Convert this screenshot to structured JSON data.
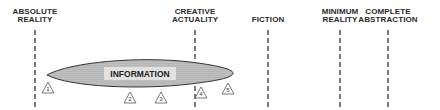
{
  "axis_labels": [
    {
      "id": "absolute-reality",
      "line1": "ABSOLUTE",
      "line2": "REALITY",
      "x": 35
    },
    {
      "id": "creative-actuality",
      "line1": "CREATIVE",
      "line2": "ACTUALITY",
      "x": 195
    },
    {
      "id": "fiction",
      "line1": "",
      "line2": "FICTION",
      "x": 268
    },
    {
      "id": "minimum-reality",
      "line1": "MINIMUM",
      "line2": "REALITY",
      "x": 340
    },
    {
      "id": "complete-abstraction",
      "line1": "COMPLETE",
      "line2": "ABSTRACTION",
      "x": 388
    }
  ],
  "region": {
    "label": "INFORMATION"
  },
  "markers": [
    {
      "num": "1",
      "x": 48,
      "y": 88
    },
    {
      "num": "2",
      "x": 130,
      "y": 98
    },
    {
      "num": "3",
      "x": 161,
      "y": 98
    },
    {
      "num": "4",
      "x": 201,
      "y": 93
    },
    {
      "num": "5",
      "x": 228,
      "y": 89
    }
  ],
  "colors": {
    "line": "#444444",
    "fill": "#bdbdbd",
    "stroke": "#333333"
  }
}
